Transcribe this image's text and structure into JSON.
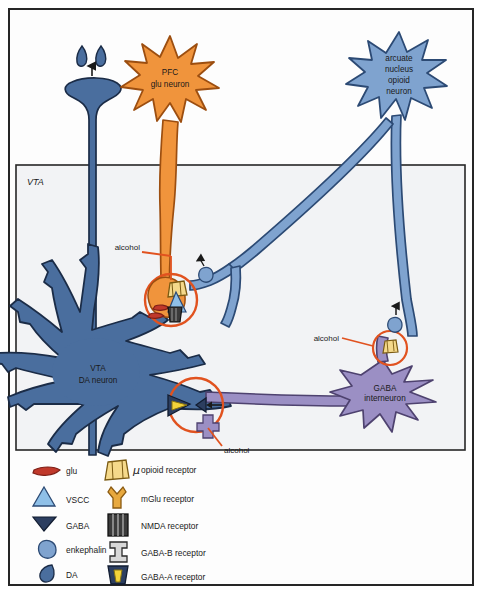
{
  "figure": {
    "region_box_label": "VTA",
    "background": "#fdfdfd",
    "frame_color": "#262626"
  },
  "colors": {
    "da_neuron_blue": "#4a6e9e",
    "da_neuron_outline": "#1b2c47",
    "afferent_light_blue": "#7fa3cf",
    "afferent_outline": "#2c4a74",
    "pfc_orange": "#f0943c",
    "pfc_outline": "#9c4e10",
    "gaba_purple": "#9b8fc4",
    "gaba_outline": "#4e426f",
    "alcohol_red": "#e1521f",
    "glu_red": "#c0392b",
    "gaba_symbol_navy": "#2c3e60",
    "nmda_dark": "#3b3b3b",
    "gabaa_yellow": "#f2d23a",
    "text": "#1a1a1a"
  },
  "neurons": [
    {
      "id": "pfc",
      "label_lines": [
        "PFC",
        "glu neuron"
      ],
      "color": "#f0943c",
      "cx": 170,
      "cy": 78
    },
    {
      "id": "arcuate",
      "label_lines": [
        "arcuate",
        "nucleus",
        "opioid",
        "neuron"
      ],
      "color": "#7fa3cf",
      "cx": 399,
      "cy": 76
    },
    {
      "id": "vta_da",
      "label_lines": [
        "VTA",
        "DA neuron"
      ],
      "color": "#4a6e9e",
      "cx": 92,
      "cy": 375
    },
    {
      "id": "gaba_in",
      "label_lines": [
        "GABA",
        "interneuron"
      ],
      "color": "#9b8fc4",
      "cx": 383,
      "cy": 393
    }
  ],
  "alcohol_labels": [
    {
      "id": "alcohol-pfc-synapse",
      "text": "alcohol",
      "x": 140,
      "y": 250
    },
    {
      "id": "alcohol-gaba-synapse",
      "text": "alcohol",
      "x": 190,
      "y": 452
    },
    {
      "id": "alcohol-interneuron",
      "text": "alcohol",
      "x": 340,
      "y": 340
    }
  ],
  "legend": {
    "neurotransmitters": [
      {
        "icon": "glu-icon",
        "label": "glu"
      },
      {
        "icon": "vscc-icon",
        "label": "VSCC"
      },
      {
        "icon": "gaba-icon",
        "label": "GABA"
      },
      {
        "icon": "enkephalin-icon",
        "label": "enkephalin"
      },
      {
        "icon": "da-icon",
        "label": "DA"
      }
    ],
    "receptors": [
      {
        "icon": "opioid-receptor-icon",
        "prefix": "μ",
        "label": "opioid receptor"
      },
      {
        "icon": "mglu-receptor-icon",
        "prefix": "",
        "label": "mGlu receptor"
      },
      {
        "icon": "nmda-receptor-icon",
        "prefix": "",
        "label": "NMDA receptor"
      },
      {
        "icon": "gabab-receptor-icon",
        "prefix": "",
        "label": "GABA-B receptor"
      },
      {
        "icon": "gabaa-receptor-icon",
        "prefix": "",
        "label": "GABA-A receptor"
      }
    ]
  }
}
